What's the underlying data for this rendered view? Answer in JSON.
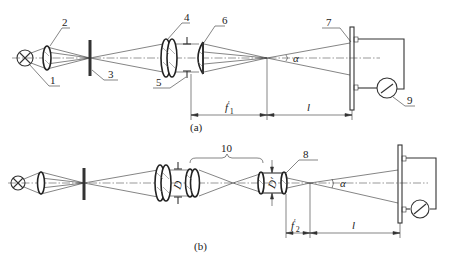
{
  "diagram": {
    "subfigures": [
      {
        "id": "a",
        "caption": "(a)",
        "part_labels": [
          "1",
          "2",
          "3",
          "4",
          "5",
          "6",
          "7",
          "9"
        ],
        "angle_label": "α",
        "dimensions": {
          "focal": "f",
          "focal_prime": "′",
          "focal_sub": "1",
          "distance": "l"
        }
      },
      {
        "id": "b",
        "caption": "(b)",
        "part_labels": [
          "8",
          "10"
        ],
        "angle_label": "α",
        "aperture_labels": [
          "D",
          "D′"
        ],
        "dimensions": {
          "focal": "f",
          "focal_prime": "′",
          "focal_sub": "2",
          "distance": "l"
        }
      }
    ],
    "colors": {
      "line": "#333333",
      "background": "#ffffff"
    }
  }
}
